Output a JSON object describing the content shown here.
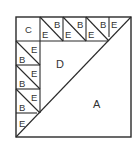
{
  "diagram": {
    "type": "quilt-block",
    "grid": 5,
    "pieces": {
      "A": "large half-square triangle (lower right)",
      "B": "small triangle in pieced square",
      "C": "corner square",
      "D": "medium triangle (upper left inner)",
      "E": "small triangle in pieced square / end triangle"
    },
    "labels": {
      "a": "A",
      "b": "B",
      "c": "C",
      "d": "D",
      "e": "E"
    }
  }
}
